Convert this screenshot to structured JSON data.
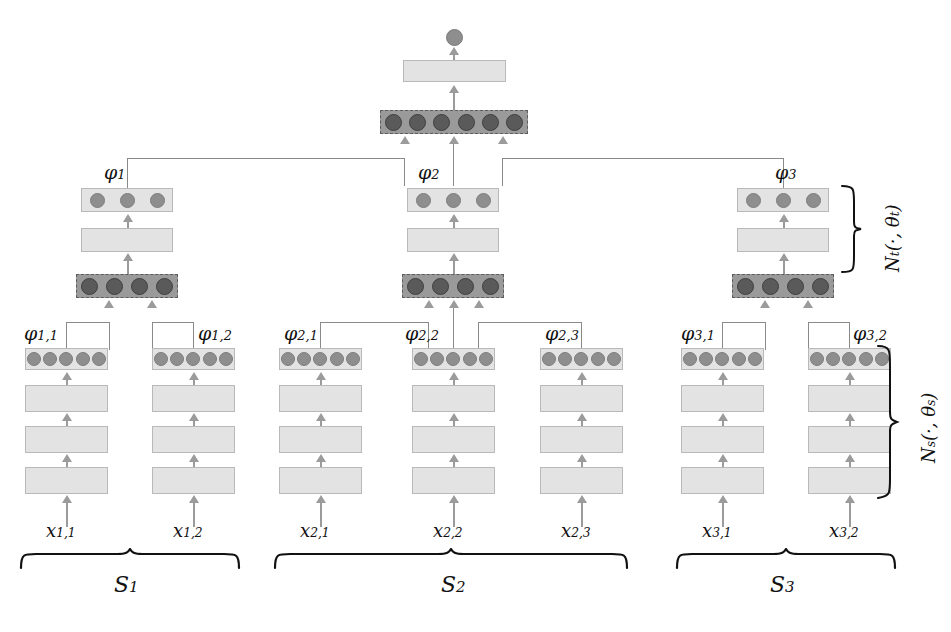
{
  "figure": {
    "type": "neural-network-architecture-diagram",
    "colors": {
      "light_block": "#e3e3e3",
      "light_block_border": "#b9b9b9",
      "dark_block": "#9a9a9a",
      "dark_block_border": "#5d5d5d",
      "light_dot": "#8e8e8e",
      "dark_dot": "#5a5a5a",
      "arrow": "#9b9b9b",
      "connector": "#8a8a8a",
      "text": "#111111",
      "background": "#ffffff"
    }
  },
  "network_labels": {
    "top_network": {
      "symbol": "N",
      "sub": "t",
      "args": "(·, θ",
      "args_sub": "t",
      "args_end": ")",
      "full": "N_t(·,θ_t)"
    },
    "bottom_network": {
      "symbol": "N",
      "sub": "s",
      "args": "(·, θ",
      "args_sub": "s",
      "args_end": ")",
      "full": "N_s(·,θ_s)"
    }
  },
  "sets": [
    {
      "name": "S",
      "sub": "1",
      "elements": [
        {
          "input": {
            "sym": "x",
            "sub": "1,1"
          },
          "embedding": {
            "sym": "φ",
            "sub": "1,1"
          }
        },
        {
          "input": {
            "sym": "x",
            "sub": "1,2"
          },
          "embedding": {
            "sym": "φ",
            "sub": "1,2"
          }
        }
      ],
      "set_embedding": {
        "sym": "φ",
        "sub": "1"
      },
      "pool_units": 4,
      "embed_units": 3
    },
    {
      "name": "S",
      "sub": "2",
      "elements": [
        {
          "input": {
            "sym": "x",
            "sub": "2,1"
          },
          "embedding": {
            "sym": "φ",
            "sub": "2,1"
          }
        },
        {
          "input": {
            "sym": "x",
            "sub": "2,2"
          },
          "embedding": {
            "sym": "φ",
            "sub": "2,2"
          }
        },
        {
          "input": {
            "sym": "x",
            "sub": "2,3"
          },
          "embedding": {
            "sym": "φ",
            "sub": "2,3"
          }
        }
      ],
      "set_embedding": {
        "sym": "φ",
        "sub": "2"
      },
      "pool_units": 4,
      "embed_units": 3
    },
    {
      "name": "S",
      "sub": "3",
      "elements": [
        {
          "input": {
            "sym": "x",
            "sub": "3,1"
          },
          "embedding": {
            "sym": "φ",
            "sub": "3,1"
          }
        },
        {
          "input": {
            "sym": "x",
            "sub": "3,2"
          },
          "embedding": {
            "sym": "φ",
            "sub": "3,2"
          }
        }
      ],
      "set_embedding": {
        "sym": "φ",
        "sub": "3"
      },
      "pool_units": 4,
      "embed_units": 3
    }
  ],
  "element_encoder": {
    "hidden_layers": 3,
    "embedding_units": 5
  },
  "top_pool": {
    "units": 6,
    "hidden_layers": 1,
    "output_units": 1
  }
}
